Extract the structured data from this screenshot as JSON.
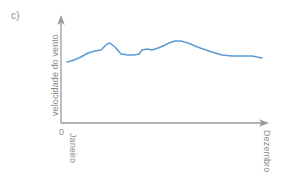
{
  "figure": {
    "panel_label": "c)",
    "colors": {
      "series_line": "#5B9BD5",
      "axis": "#9a9a9a",
      "text": "#8a8a8a",
      "background": "#FFFFFF"
    }
  },
  "chart_data": {
    "type": "line",
    "title": "",
    "subtitle": "",
    "panel": "c)",
    "xlabel": "",
    "ylabel": "velocidade do vento",
    "x_tick_labels": [
      "Janeiro",
      "Dezembro"
    ],
    "y_tick_labels": [
      "0"
    ],
    "origin_label": "0",
    "grid": false,
    "legend": null,
    "axis_arrows": {
      "x": "right-arrow",
      "y": "up-arrow"
    },
    "xlim": [
      0,
      12
    ],
    "ylim": [
      0,
      10
    ],
    "annotations": [],
    "series": [
      {
        "name": "velocidade do vento",
        "color": "#5B9BD5",
        "x": [
          0.3,
          0.8,
          1.3,
          1.8,
          2.3,
          2.7,
          3.1,
          3.4,
          3.7,
          4.1,
          4.6,
          5.0,
          5.3,
          5.6,
          5.9,
          6.2,
          6.6,
          7.0,
          7.4,
          7.8,
          8.2,
          8.7,
          9.2,
          9.8,
          10.4,
          11.0,
          11.5,
          11.9
        ],
        "values": [
          4.05,
          4.3,
          4.65,
          5.1,
          5.35,
          5.5,
          6.1,
          5.85,
          5.1,
          5.05,
          5.05,
          5.1,
          5.2,
          5.75,
          5.6,
          5.6,
          5.95,
          6.25,
          6.5,
          6.35,
          6.05,
          5.7,
          5.4,
          5.35,
          5.35,
          5.35,
          5.3,
          5.2
        ]
      }
    ],
    "path_points_px": [
      [
        67,
        62
      ],
      [
        74,
        60
      ],
      [
        81,
        57
      ],
      [
        88,
        53
      ],
      [
        95,
        51
      ],
      [
        101,
        50
      ],
      [
        107,
        44
      ],
      [
        110,
        43
      ],
      [
        115,
        47
      ],
      [
        121,
        54
      ],
      [
        128,
        55
      ],
      [
        134,
        55
      ],
      [
        139,
        54
      ],
      [
        142,
        50
      ],
      [
        147,
        49
      ],
      [
        152,
        50
      ],
      [
        158,
        48
      ],
      [
        163,
        46
      ],
      [
        169,
        43
      ],
      [
        175,
        41
      ],
      [
        181,
        41
      ],
      [
        188,
        43
      ],
      [
        195,
        46
      ],
      [
        203,
        49
      ],
      [
        212,
        52
      ],
      [
        222,
        55
      ],
      [
        232,
        56
      ],
      [
        243,
        56
      ],
      [
        252,
        56
      ],
      [
        262,
        58
      ]
    ]
  }
}
